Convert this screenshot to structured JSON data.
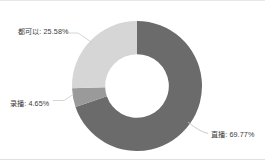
{
  "chart_data": {
    "type": "pie",
    "variant": "donut",
    "title": "",
    "subtitle": "",
    "xlabel": "",
    "ylabel": "",
    "legend": false,
    "legend_position": "none",
    "grid": false,
    "labels_outside": true,
    "leader_lines": true,
    "start_angle_deg": 0,
    "direction": "clockwise",
    "inner_radius_ratio": 0.49,
    "categories": [
      "直播",
      "录播",
      "都可以"
    ],
    "values": [
      69.77,
      4.65,
      25.58
    ],
    "value_unit": "%",
    "colors": [
      "#6b6b6b",
      "#9a9a9a",
      "#d6d6d6"
    ],
    "slices": [
      {
        "name": "直播",
        "value": 69.77,
        "label": "直播: 69.77%",
        "color": "#6b6b6b",
        "label_position": "right-bottom"
      },
      {
        "name": "录播",
        "value": 4.65,
        "label": "录播: 4.65%",
        "color": "#9a9a9a",
        "label_position": "left-middle"
      },
      {
        "name": "都可以",
        "value": 25.58,
        "label": "都可以: 25.58%",
        "color": "#d6d6d6",
        "label_position": "left-top"
      }
    ]
  },
  "labels": {
    "dukeyi": "都可以: 25.58%",
    "lubo": "录播: 4.65%",
    "zhibo": "直播: 69.77%"
  },
  "colors": {
    "background": "#ffffff",
    "text": "#3a3a3a",
    "leader_line": "#bdbdbd",
    "border": "#e4e4e4",
    "slice_dark": "#6b6b6b",
    "slice_mid": "#9a9a9a",
    "slice_light": "#d6d6d6"
  }
}
